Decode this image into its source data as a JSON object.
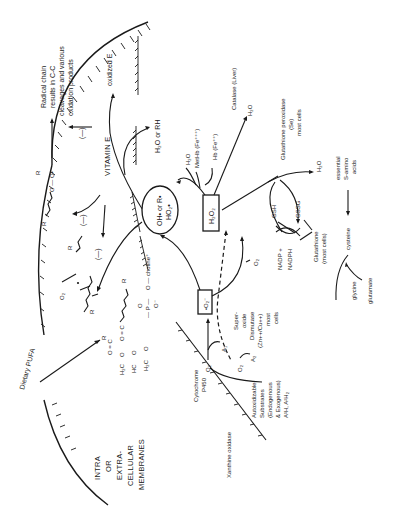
{
  "diagram": {
    "orientation": "rotated-90-ccw",
    "regions": {
      "membrane_label": [
        "INTRA",
        "OR",
        "EXTRA-",
        "CELLULAR",
        "MEMBRANES"
      ],
      "dietary": "Dietary PUFA"
    },
    "nodes": {
      "radical_center": {
        "line1": "OH• or R•",
        "line2": "HO₂•"
      },
      "h2o2": "H₂O₂",
      "superoxide": "•O₂⁻",
      "vitamin_e": "VITAMIN E",
      "oxidized_e": "oxidized E",
      "h2o_or_rh": "H₂O or RH",
      "radical_chain": [
        "Radical chain",
        "results in C-C",
        "cleavages and various",
        "oxidation products"
      ],
      "peroxyl": "O — O•",
      "inhibit_1": "(—)",
      "inhibit_2": "(—)",
      "inhibit_3": "(—)",
      "o2_lipid": "O₂",
      "r_labels": [
        "R",
        "R",
        "R",
        "R",
        "R"
      ],
      "phospholipid": {
        "choline": "O — choline⁺",
        "phosphate": "— P —",
        "carbonyl_o": "O",
        "anion_o": "O⁻",
        "ch2_1": "H₂C",
        "ch_2": "HC",
        "ch2_3": "H₂C",
        "ester1": "O = C",
        "ester2": "O = C",
        "o_links": [
          "O",
          "O",
          "O"
        ]
      },
      "h2o_1": "H₂O",
      "methb": "MetHb (Fe⁺⁺⁺)",
      "hb": "Hb (Fe⁺⁺)",
      "catalase": "Catalase (Liver)",
      "h2o_catalase": "H₂O",
      "gpx": [
        "Glutathione peroxidase",
        "(Se)",
        "most cells"
      ],
      "h2o_gpx": "H₂O",
      "gsh": "GSH",
      "gssg": "GSSG",
      "nadp_plus": "NADP +",
      "nadph": "NADPH",
      "glutathione": [
        "Glutathione",
        "(most cells)"
      ],
      "o2_sod": "O₂",
      "sod": [
        "Super-",
        "oxide",
        "Dismutase",
        "(Zn++/Cu++)",
        "most",
        "cells"
      ],
      "essential_aa": [
        "essential",
        "S-amino",
        "acids"
      ],
      "cysteine": "cysteine",
      "glycine": "glycine",
      "glutamate": "glutamate",
      "a1": "A₁",
      "a2": "A₂",
      "o2_a1": "O₂",
      "o2_a2": "O₂",
      "autoxidizable": [
        "Autoxidizable",
        "Substrates",
        "(Endogenous",
        "& Exogenous)",
        "A¹H, A²H₂"
      ],
      "cyt_p450": [
        "Cytochrome",
        "P450"
      ],
      "xanthine_oxidase": "Xanthine oxidase"
    },
    "colors": {
      "ink": "#1a1a1a",
      "background": "#ffffff"
    }
  }
}
